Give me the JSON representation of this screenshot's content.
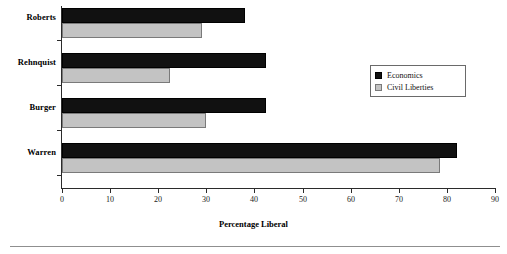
{
  "chart_data": {
    "type": "bar",
    "orientation": "horizontal",
    "title": "",
    "xlabel": "Percentage Liberal",
    "ylabel": "",
    "categories": [
      "Warren",
      "Burger",
      "Rehnquist",
      "Roberts"
    ],
    "series": [
      {
        "name": "Economics",
        "color": "#111111",
        "values": [
          82,
          42.5,
          42.5,
          38
        ]
      },
      {
        "name": "Civil Liberties",
        "color": "#c3c3c3",
        "values": [
          78.5,
          30,
          22.5,
          29
        ]
      }
    ],
    "xlim": [
      0,
      90
    ],
    "xticks": [
      0,
      10,
      20,
      30,
      40,
      50,
      60,
      70,
      80,
      90
    ],
    "xtick_labels": [
      "0",
      "10",
      "20",
      "30",
      "40",
      "50",
      "60",
      "70",
      "80",
      "90"
    ],
    "grid": false,
    "legend_position": "center-right"
  },
  "axis": {
    "x_title": "Percentage Liberal",
    "tick_labels": [
      "0",
      "10",
      "20",
      "30",
      "40",
      "50",
      "60",
      "70",
      "80",
      "90"
    ]
  },
  "categories": [
    {
      "label": "Roberts",
      "economics": 38,
      "civil_liberties": 29
    },
    {
      "label": "Rehnquist",
      "economics": 42.5,
      "civil_liberties": 22.5
    },
    {
      "label": "Burger",
      "economics": 42.5,
      "civil_liberties": 30
    },
    {
      "label": "Warren",
      "economics": 82,
      "civil_liberties": 78.5
    }
  ],
  "legend": {
    "items": [
      {
        "label": "Economics",
        "color": "#111111"
      },
      {
        "label": "Civil Liberties",
        "color": "#c3c3c3"
      }
    ]
  }
}
